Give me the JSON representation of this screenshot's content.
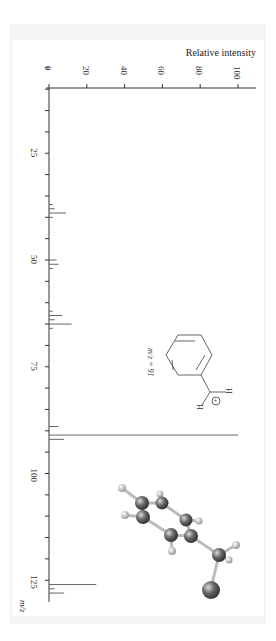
{
  "chart_data": {
    "type": "bar",
    "orientation": "rotated-90",
    "title": "",
    "xlabel": "m/z",
    "ylabel": "Relative intensity",
    "xlim": [
      0,
      130
    ],
    "ylim": [
      0,
      100
    ],
    "x_ticks": [
      25,
      50,
      75,
      100,
      125
    ],
    "x_minor_step": 5,
    "y_ticks": [
      0,
      20,
      40,
      60,
      80,
      100
    ],
    "grid": false,
    "peaks": [
      {
        "mz": 37,
        "intensity": 2
      },
      {
        "mz": 38,
        "intensity": 3
      },
      {
        "mz": 39,
        "intensity": 9
      },
      {
        "mz": 40,
        "intensity": 2
      },
      {
        "mz": 50,
        "intensity": 4
      },
      {
        "mz": 51,
        "intensity": 5
      },
      {
        "mz": 52,
        "intensity": 2
      },
      {
        "mz": 62,
        "intensity": 2
      },
      {
        "mz": 63,
        "intensity": 7
      },
      {
        "mz": 64,
        "intensity": 3
      },
      {
        "mz": 65,
        "intensity": 12
      },
      {
        "mz": 66,
        "intensity": 2
      },
      {
        "mz": 89,
        "intensity": 5
      },
      {
        "mz": 91,
        "intensity": 100
      },
      {
        "mz": 92,
        "intensity": 8
      },
      {
        "mz": 126,
        "intensity": 25
      },
      {
        "mz": 127,
        "intensity": 3
      },
      {
        "mz": 128,
        "intensity": 8
      }
    ],
    "annotations": [
      {
        "text": "m/z = 91",
        "target": "benzyl cation structure"
      },
      {
        "text": "H",
        "target": "structure hydrogen"
      },
      {
        "text": "⊕",
        "target": "positive charge"
      }
    ]
  },
  "labels": {
    "y_axis_title": "Relative intensity",
    "x_axis_title": "m/z",
    "ion_label": "m/z = 91",
    "h1": "H",
    "h2": "H",
    "plus": "+"
  },
  "y_tick_labels": [
    "0",
    "20",
    "40",
    "60",
    "80",
    "100"
  ],
  "x_tick_labels": [
    "25",
    "50",
    "75",
    "100",
    "125"
  ]
}
